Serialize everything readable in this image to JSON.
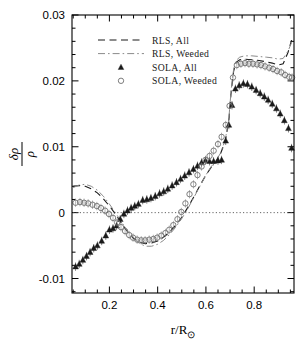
{
  "figure": {
    "background": "#ffffff",
    "frame_color": "#000000",
    "zero_line_color": "#555555"
  },
  "axes": {
    "x": {
      "label": "r/R",
      "label_sub": "⊙",
      "tick_labels": [
        "0.2",
        "0.4",
        "0.6",
        "0.8"
      ],
      "tick_values": [
        0.2,
        0.4,
        0.6,
        0.8
      ],
      "range": [
        0.045,
        0.965
      ],
      "minor_per_major": 4
    },
    "y": {
      "label_num": "δρ",
      "label_den": "ρ",
      "tick_labels": [
        "0.03",
        "0.02",
        "0.01",
        "0",
        "-0.01"
      ],
      "tick_values": [
        0.03,
        0.02,
        0.01,
        0,
        -0.01
      ],
      "range": [
        -0.0122,
        0.03
      ],
      "minor_per_major": 5
    }
  },
  "legend": {
    "entries": [
      {
        "label": "RLS, All",
        "style": "dashed",
        "color": "#1a1a1a"
      },
      {
        "label": "RLS, Weeded",
        "style": "dashdot",
        "color": "#8a8a8a"
      },
      {
        "label": "SOLA, All",
        "style": "triangle",
        "color": "#1a1a1a"
      },
      {
        "label": "SOLA, Weeded",
        "style": "circle",
        "color": "#777777"
      }
    ]
  },
  "chart_data": {
    "type": "line",
    "title": "",
    "xlabel": "r/R⊙",
    "ylabel": "δρ/ρ",
    "xlim": [
      0.045,
      0.965
    ],
    "ylim": [
      -0.0122,
      0.03
    ],
    "grid": false,
    "legend_position": "upper-left",
    "reference_lines": [
      {
        "axis": "y",
        "value": 0,
        "style": "dotted"
      }
    ],
    "series": [
      {
        "name": "RLS, All",
        "style": "dashed",
        "type": "line",
        "points": [
          [
            0.05,
            0.004
          ],
          [
            0.075,
            0.0041
          ],
          [
            0.1,
            0.004
          ],
          [
            0.125,
            0.0036
          ],
          [
            0.15,
            0.003
          ],
          [
            0.175,
            0.0021
          ],
          [
            0.2,
            0.001
          ],
          [
            0.225,
            -0.0002
          ],
          [
            0.25,
            -0.0016
          ],
          [
            0.275,
            -0.0029
          ],
          [
            0.3,
            -0.0039
          ],
          [
            0.325,
            -0.0045
          ],
          [
            0.35,
            -0.0047
          ],
          [
            0.375,
            -0.0046
          ],
          [
            0.4,
            -0.0043
          ],
          [
            0.425,
            -0.0037
          ],
          [
            0.45,
            -0.0029
          ],
          [
            0.475,
            -0.0019
          ],
          [
            0.5,
            -0.0007
          ],
          [
            0.525,
            0.0008
          ],
          [
            0.55,
            0.0024
          ],
          [
            0.575,
            0.0041
          ],
          [
            0.6,
            0.0057
          ],
          [
            0.62,
            0.0068
          ],
          [
            0.64,
            0.0077
          ],
          [
            0.66,
            0.0089
          ],
          [
            0.68,
            0.0108
          ],
          [
            0.695,
            0.014
          ],
          [
            0.705,
            0.0185
          ],
          [
            0.715,
            0.0215
          ],
          [
            0.725,
            0.0228
          ],
          [
            0.74,
            0.0232
          ],
          [
            0.76,
            0.0233
          ],
          [
            0.79,
            0.0232
          ],
          [
            0.82,
            0.0231
          ],
          [
            0.85,
            0.0229
          ],
          [
            0.875,
            0.0227
          ],
          [
            0.9,
            0.0224
          ],
          [
            0.92,
            0.0226
          ],
          [
            0.94,
            0.0243
          ],
          [
            0.955,
            0.0262
          ]
        ]
      },
      {
        "name": "RLS, Weeded",
        "style": "dashdot",
        "type": "line",
        "points": [
          [
            0.05,
            0.0038
          ],
          [
            0.075,
            0.0042
          ],
          [
            0.1,
            0.0043
          ],
          [
            0.125,
            0.004
          ],
          [
            0.15,
            0.0034
          ],
          [
            0.175,
            0.0025
          ],
          [
            0.2,
            0.0013
          ],
          [
            0.225,
            0.0
          ],
          [
            0.25,
            -0.0014
          ],
          [
            0.275,
            -0.0028
          ],
          [
            0.3,
            -0.0039
          ],
          [
            0.325,
            -0.0047
          ],
          [
            0.35,
            -0.0051
          ],
          [
            0.375,
            -0.0051
          ],
          [
            0.4,
            -0.0048
          ],
          [
            0.425,
            -0.0042
          ],
          [
            0.45,
            -0.0033
          ],
          [
            0.475,
            -0.0022
          ],
          [
            0.5,
            -0.0009
          ],
          [
            0.525,
            0.0006
          ],
          [
            0.55,
            0.0023
          ],
          [
            0.575,
            0.004
          ],
          [
            0.6,
            0.0057
          ],
          [
            0.62,
            0.0069
          ],
          [
            0.64,
            0.0078
          ],
          [
            0.66,
            0.009
          ],
          [
            0.68,
            0.011
          ],
          [
            0.695,
            0.0143
          ],
          [
            0.705,
            0.0188
          ],
          [
            0.715,
            0.0218
          ],
          [
            0.725,
            0.0231
          ],
          [
            0.74,
            0.0236
          ],
          [
            0.76,
            0.0238
          ],
          [
            0.79,
            0.0238
          ],
          [
            0.82,
            0.0237
          ],
          [
            0.85,
            0.0236
          ],
          [
            0.875,
            0.0235
          ],
          [
            0.9,
            0.0233
          ],
          [
            0.92,
            0.0234
          ],
          [
            0.94,
            0.0245
          ],
          [
            0.955,
            0.0258
          ]
        ]
      },
      {
        "name": "SOLA, All",
        "style": "triangle",
        "type": "scatter",
        "points": [
          [
            0.06,
            -0.0082
          ],
          [
            0.075,
            -0.0078
          ],
          [
            0.09,
            -0.0072
          ],
          [
            0.105,
            -0.0066
          ],
          [
            0.12,
            -0.006
          ],
          [
            0.135,
            -0.0054
          ],
          [
            0.15,
            -0.005
          ],
          [
            0.168,
            -0.0043
          ],
          [
            0.185,
            -0.0035
          ],
          [
            0.2,
            -0.0026
          ],
          [
            0.215,
            -0.0024
          ],
          [
            0.23,
            -0.002
          ],
          [
            0.245,
            -0.001
          ],
          [
            0.26,
            -0.0002
          ],
          [
            0.275,
            0.0003
          ],
          [
            0.29,
            0.0007
          ],
          [
            0.305,
            0.001
          ],
          [
            0.32,
            0.0013
          ],
          [
            0.338,
            0.0019
          ],
          [
            0.355,
            0.002
          ],
          [
            0.372,
            0.0022
          ],
          [
            0.39,
            0.0025
          ],
          [
            0.408,
            0.0029
          ],
          [
            0.425,
            0.0032
          ],
          [
            0.442,
            0.0036
          ],
          [
            0.46,
            0.0041
          ],
          [
            0.478,
            0.0046
          ],
          [
            0.495,
            0.0051
          ],
          [
            0.512,
            0.0056
          ],
          [
            0.53,
            0.0061
          ],
          [
            0.548,
            0.0066
          ],
          [
            0.565,
            0.0071
          ],
          [
            0.582,
            0.0076
          ],
          [
            0.598,
            0.0079
          ],
          [
            0.615,
            0.0078
          ],
          [
            0.632,
            0.0078
          ],
          [
            0.65,
            0.0079
          ],
          [
            0.665,
            0.008
          ],
          [
            0.682,
            0.0109
          ],
          [
            0.695,
            0.0133
          ],
          [
            0.708,
            0.0163
          ],
          [
            0.722,
            0.0188
          ],
          [
            0.738,
            0.0193
          ],
          [
            0.755,
            0.0196
          ],
          [
            0.772,
            0.0195
          ],
          [
            0.79,
            0.0191
          ],
          [
            0.808,
            0.0186
          ],
          [
            0.825,
            0.0181
          ],
          [
            0.842,
            0.0176
          ],
          [
            0.858,
            0.0171
          ],
          [
            0.875,
            0.0165
          ],
          [
            0.892,
            0.0158
          ],
          [
            0.908,
            0.015
          ],
          [
            0.925,
            0.014
          ],
          [
            0.942,
            0.0128
          ],
          [
            0.955,
            0.0098
          ]
        ]
      },
      {
        "name": "SOLA, Weeded",
        "style": "circle",
        "type": "scatter",
        "points": [
          [
            0.06,
            0.0015
          ],
          [
            0.078,
            0.0016
          ],
          [
            0.095,
            0.0015
          ],
          [
            0.112,
            0.0014
          ],
          [
            0.13,
            0.0012
          ],
          [
            0.148,
            0.001
          ],
          [
            0.165,
            0.0007
          ],
          [
            0.182,
            0.0003
          ],
          [
            0.198,
            -0.0002
          ],
          [
            0.215,
            -0.0008
          ],
          [
            0.232,
            -0.0015
          ],
          [
            0.248,
            -0.0022
          ],
          [
            0.265,
            -0.0028
          ],
          [
            0.282,
            -0.0034
          ],
          [
            0.298,
            -0.0038
          ],
          [
            0.315,
            -0.0041
          ],
          [
            0.332,
            -0.0042
          ],
          [
            0.348,
            -0.0042
          ],
          [
            0.365,
            -0.0041
          ],
          [
            0.382,
            -0.004
          ],
          [
            0.398,
            -0.0038
          ],
          [
            0.415,
            -0.0035
          ],
          [
            0.432,
            -0.0031
          ],
          [
            0.448,
            -0.0026
          ],
          [
            0.465,
            -0.0019
          ],
          [
            0.482,
            -0.001
          ],
          [
            0.498,
            0.0001
          ],
          [
            0.515,
            0.0014
          ],
          [
            0.532,
            0.0028
          ],
          [
            0.548,
            0.0043
          ],
          [
            0.565,
            0.0057
          ],
          [
            0.582,
            0.007
          ],
          [
            0.598,
            0.008
          ],
          [
            0.615,
            0.0086
          ],
          [
            0.632,
            0.0094
          ],
          [
            0.65,
            0.0104
          ],
          [
            0.665,
            0.0115
          ],
          [
            0.682,
            0.0133
          ],
          [
            0.698,
            0.0162
          ],
          [
            0.712,
            0.0205
          ],
          [
            0.728,
            0.0224
          ],
          [
            0.745,
            0.0226
          ],
          [
            0.762,
            0.0227
          ],
          [
            0.778,
            0.0226
          ],
          [
            0.795,
            0.0226
          ],
          [
            0.812,
            0.0225
          ],
          [
            0.828,
            0.0224
          ],
          [
            0.845,
            0.0222
          ],
          [
            0.862,
            0.022
          ],
          [
            0.878,
            0.0218
          ],
          [
            0.895,
            0.0215
          ],
          [
            0.912,
            0.0213
          ],
          [
            0.928,
            0.0209
          ],
          [
            0.945,
            0.0206
          ],
          [
            0.957,
            0.0205
          ]
        ]
      }
    ]
  }
}
